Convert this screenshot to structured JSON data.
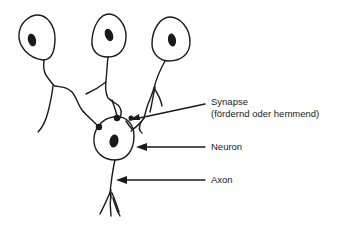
{
  "diagram": {
    "type": "neuron-synapse-schematic",
    "labels": {
      "synapse_line1": "Synapse",
      "synapse_line2": "(fördernd oder hemmend)",
      "neuron": "Neuron",
      "axon": "Axon"
    },
    "colors": {
      "stroke": "#1a1a1a",
      "background": "#ffffff"
    }
  }
}
